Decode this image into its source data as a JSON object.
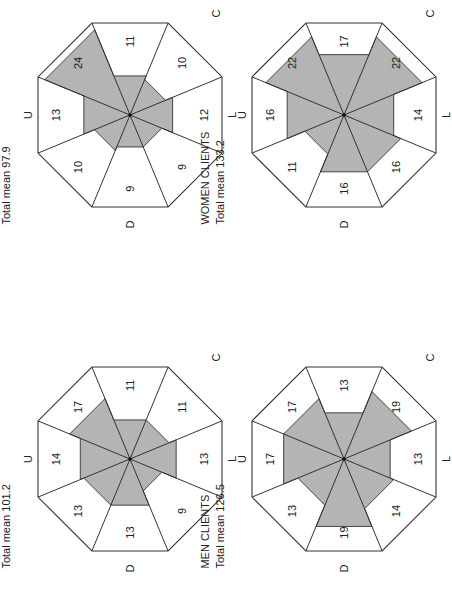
{
  "figure": {
    "orientation": "rotated 90deg clockwise",
    "fill_color": "#b4b4b4",
    "line_color": "#333333",
    "panels": [
      {
        "id": "women-students",
        "title": "WOMEN STUDENTS",
        "subtitle": "Total mean 97.9",
        "center": [
          130,
          115
        ],
        "axis_labels": {
          "C": "C",
          "U": "U",
          "L": "L",
          "D": "D"
        },
        "sectors": [
          11,
          10,
          12,
          9,
          9,
          10,
          13,
          24
        ]
      },
      {
        "id": "women-clients",
        "title": "WOMEN CLIENTS",
        "subtitle": "Total mean 133.2",
        "center": [
          344,
          115
        ],
        "axis_labels": {
          "C": "C",
          "U": "U",
          "L": "L",
          "D": "D"
        },
        "sectors": [
          17,
          22,
          14,
          16,
          16,
          11,
          16,
          22
        ]
      },
      {
        "id": "men-students",
        "title": "MEN STUDENTS",
        "subtitle": "Total mean 101.2",
        "center": [
          130,
          459
        ],
        "axis_labels": {
          "C": "C",
          "U": "U",
          "L": "L",
          "D": "D"
        },
        "sectors": [
          11,
          11,
          13,
          9,
          13,
          13,
          14,
          17
        ]
      },
      {
        "id": "men-clients",
        "title": "MEN CLIENTS",
        "subtitle": "Total mean 126.5",
        "center": [
          344,
          459
        ],
        "axis_labels": {
          "C": "C",
          "U": "U",
          "L": "L",
          "D": "D"
        },
        "sectors": [
          13,
          19,
          13,
          14,
          19,
          13,
          17,
          17
        ]
      }
    ],
    "sector_order_note": "clockwise from top edge in screen coords: top(C side), top-right, right(L), bottom-right, bottom(D), bottom-left, left(U), top-left"
  }
}
